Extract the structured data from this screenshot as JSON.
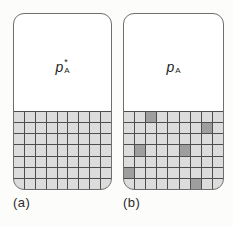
{
  "figure": {
    "colors": {
      "solvent_cell": "#dcdcdc",
      "solute_cell": "#9e9e9e",
      "grid_line": "#4d4d4d",
      "vessel_outline": "#6e6e6e",
      "vapor_region": "#ffffff",
      "background": "#fcfcfa"
    },
    "panels": [
      {
        "id": "a",
        "caption": "(a)",
        "label": {
          "base": "p",
          "superscript": "*",
          "subscript": "A"
        },
        "grid": {
          "columns": 9,
          "rows": 7,
          "solute_cells": []
        }
      },
      {
        "id": "b",
        "caption": "(b)",
        "label": {
          "base": "p",
          "superscript": "",
          "subscript": "A"
        },
        "grid": {
          "columns": 9,
          "rows": 7,
          "solute_cells": [
            [
              0,
              2
            ],
            [
              1,
              7
            ],
            [
              3,
              1
            ],
            [
              3,
              5
            ],
            [
              5,
              0
            ],
            [
              6,
              6
            ]
          ]
        }
      }
    ]
  }
}
